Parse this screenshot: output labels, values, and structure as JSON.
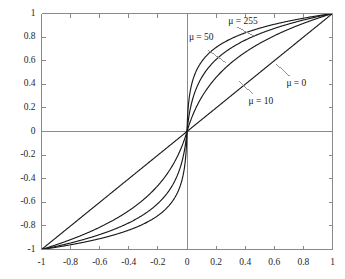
{
  "chart_data": {
    "type": "line",
    "title": "",
    "xlabel": "",
    "ylabel": "",
    "xlim": [
      -1,
      1
    ],
    "ylim": [
      -1,
      1
    ],
    "grid": false,
    "legend_position": "inline-annotations",
    "xticks": [
      "-1",
      "-0.8",
      "-0.6",
      "-0.4",
      "-0.2",
      "0",
      "0.2",
      "0.4",
      "0.6",
      "0.8",
      "1"
    ],
    "xtick_values": [
      -1,
      -0.8,
      -0.6,
      -0.4,
      -0.2,
      0,
      0.2,
      0.4,
      0.6,
      0.8,
      1
    ],
    "yticks": [
      "1",
      "0.8",
      "0.6",
      "0.4",
      "0.2",
      "0",
      "-0.2",
      "-0.4",
      "-0.6",
      "-0.8",
      "-1"
    ],
    "ytick_values": [
      1,
      0.8,
      0.6,
      0.4,
      0.2,
      0,
      -0.2,
      -0.4,
      -0.6,
      -0.8,
      -1
    ],
    "x": [
      -1,
      -0.95,
      -0.9,
      -0.85,
      -0.8,
      -0.75,
      -0.7,
      -0.65,
      -0.6,
      -0.55,
      -0.5,
      -0.45,
      -0.4,
      -0.35,
      -0.3,
      -0.25,
      -0.2,
      -0.15,
      -0.1,
      -0.05,
      0,
      0.05,
      0.1,
      0.15,
      0.2,
      0.25,
      0.3,
      0.35,
      0.4,
      0.45,
      0.5,
      0.55,
      0.6,
      0.65,
      0.7,
      0.75,
      0.8,
      0.85,
      0.9,
      0.95,
      1
    ],
    "series": [
      {
        "name": "mu = 0",
        "label": "μ = 0",
        "mu": 0,
        "color": "#1a1a1a",
        "values": [
          -1,
          -0.95,
          -0.9,
          -0.85,
          -0.8,
          -0.75,
          -0.7,
          -0.65,
          -0.6,
          -0.55,
          -0.5,
          -0.45,
          -0.4,
          -0.35,
          -0.3,
          -0.25,
          -0.2,
          -0.15,
          -0.1,
          -0.05,
          0,
          0.05,
          0.1,
          0.15,
          0.2,
          0.25,
          0.3,
          0.35,
          0.4,
          0.45,
          0.5,
          0.55,
          0.6,
          0.65,
          0.7,
          0.75,
          0.8,
          0.85,
          0.9,
          0.95,
          1
        ]
      },
      {
        "name": "mu = 10",
        "label": "μ = 10",
        "mu": 10,
        "color": "#1a1a1a",
        "values": [
          -1,
          -0.982,
          -0.963,
          -0.944,
          -0.923,
          -0.901,
          -0.878,
          -0.853,
          -0.827,
          -0.799,
          -0.769,
          -0.737,
          -0.703,
          -0.666,
          -0.626,
          -0.583,
          -0.536,
          -0.484,
          -0.427,
          -0.362,
          0,
          0.362,
          0.427,
          0.484,
          0.536,
          0.583,
          0.626,
          0.666,
          0.703,
          0.737,
          0.769,
          0.799,
          0.827,
          0.853,
          0.878,
          0.901,
          0.923,
          0.944,
          0.963,
          0.982,
          1
        ]
      },
      {
        "name": "mu = 50",
        "label": "μ = 50",
        "mu": 50,
        "color": "#1a1a1a",
        "values": [
          -1,
          -0.988,
          -0.975,
          -0.962,
          -0.948,
          -0.933,
          -0.917,
          -0.9,
          -0.882,
          -0.862,
          -0.84,
          -0.817,
          -0.791,
          -0.762,
          -0.73,
          -0.694,
          -0.652,
          -0.604,
          -0.545,
          -0.469,
          0,
          0.469,
          0.545,
          0.604,
          0.652,
          0.694,
          0.73,
          0.762,
          0.791,
          0.817,
          0.84,
          0.862,
          0.882,
          0.9,
          0.917,
          0.933,
          0.948,
          0.962,
          0.975,
          0.988,
          1
        ]
      },
      {
        "name": "mu = 255",
        "label": "μ = 255",
        "mu": 255,
        "color": "#1a1a1a",
        "values": [
          -1,
          -0.991,
          -0.982,
          -0.973,
          -0.963,
          -0.952,
          -0.941,
          -0.929,
          -0.916,
          -0.902,
          -0.886,
          -0.869,
          -0.85,
          -0.829,
          -0.805,
          -0.777,
          -0.745,
          -0.706,
          -0.658,
          -0.591,
          0,
          0.591,
          0.658,
          0.706,
          0.745,
          0.777,
          0.805,
          0.829,
          0.85,
          0.869,
          0.886,
          0.902,
          0.916,
          0.929,
          0.941,
          0.952,
          0.963,
          0.973,
          0.982,
          0.991,
          1
        ]
      }
    ],
    "annotations": [
      {
        "text": "μ = 255",
        "x": 0.29,
        "y": 0.93
      },
      {
        "text": "μ = 50",
        "x": 0.02,
        "y": 0.79
      },
      {
        "text": "μ = 0",
        "x": 0.69,
        "y": 0.4
      },
      {
        "text": "μ = 10",
        "x": 0.43,
        "y": 0.25
      }
    ]
  },
  "axes": {
    "frame_color": "#8a8a8a",
    "zero_line_color": "#8a8a8a",
    "curve_color": "#1a1a1a",
    "leader_color": "#8a8a8a",
    "background": "#ffffff"
  }
}
